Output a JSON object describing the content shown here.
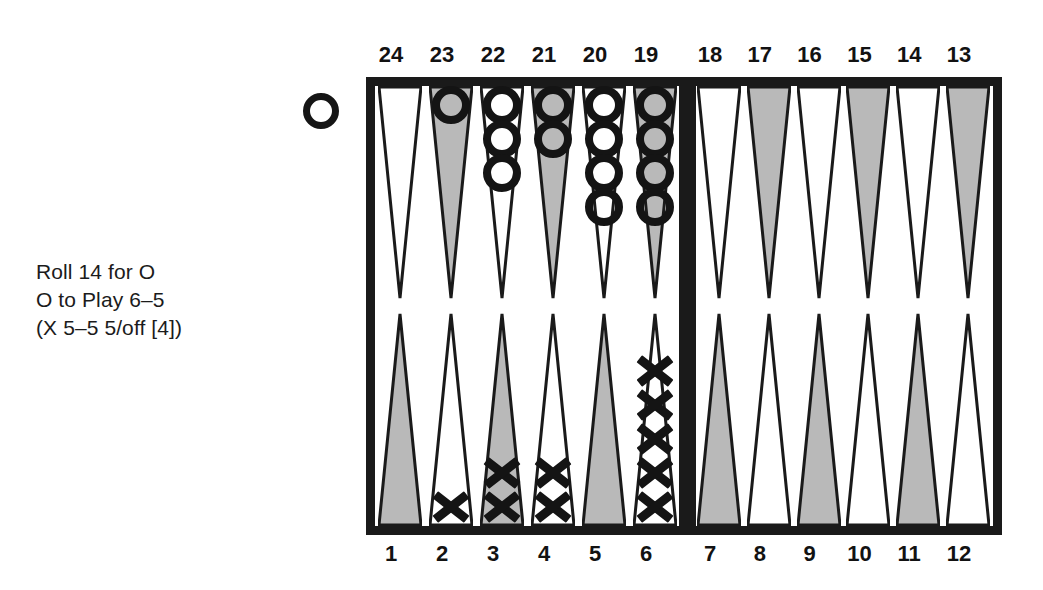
{
  "caption": {
    "line1": "Roll 14 for O",
    "line2": "O to Play 6–5",
    "line3": "(X 5–5 5/off [4])"
  },
  "off_marker": {
    "player": "O",
    "label": "O"
  },
  "colors": {
    "ink": "#1a1a1a",
    "point_shaded": "#b9b9b9",
    "point_light": "#ffffff",
    "background": "#ffffff"
  },
  "board": {
    "numbers_top_left": [
      "24",
      "23",
      "22",
      "21",
      "20",
      "19"
    ],
    "numbers_top_right": [
      "18",
      "17",
      "16",
      "15",
      "14",
      "13"
    ],
    "numbers_bottom_left": [
      "1",
      "2",
      "3",
      "4",
      "5",
      "6"
    ],
    "numbers_bottom_right": [
      "7",
      "8",
      "9",
      "10",
      "11",
      "12"
    ],
    "quadrants": {
      "top_left": [
        {
          "point": "24",
          "shade": "light",
          "checkers": 0,
          "player": ""
        },
        {
          "point": "23",
          "shade": "shaded",
          "checkers": 1,
          "player": "O"
        },
        {
          "point": "22",
          "shade": "light",
          "checkers": 3,
          "player": "O"
        },
        {
          "point": "21",
          "shade": "shaded",
          "checkers": 2,
          "player": "O"
        },
        {
          "point": "20",
          "shade": "light",
          "checkers": 4,
          "player": "O"
        },
        {
          "point": "19",
          "shade": "shaded",
          "checkers": 4,
          "player": "O"
        }
      ],
      "top_right": [
        {
          "point": "18",
          "shade": "light",
          "checkers": 0,
          "player": ""
        },
        {
          "point": "17",
          "shade": "shaded",
          "checkers": 0,
          "player": ""
        },
        {
          "point": "16",
          "shade": "light",
          "checkers": 0,
          "player": ""
        },
        {
          "point": "15",
          "shade": "shaded",
          "checkers": 0,
          "player": ""
        },
        {
          "point": "14",
          "shade": "light",
          "checkers": 0,
          "player": ""
        },
        {
          "point": "13",
          "shade": "shaded",
          "checkers": 0,
          "player": ""
        }
      ],
      "bottom_left": [
        {
          "point": "1",
          "shade": "shaded",
          "checkers": 0,
          "player": ""
        },
        {
          "point": "2",
          "shade": "light",
          "checkers": 1,
          "player": "X"
        },
        {
          "point": "3",
          "shade": "shaded",
          "checkers": 2,
          "player": "X"
        },
        {
          "point": "4",
          "shade": "light",
          "checkers": 2,
          "player": "X"
        },
        {
          "point": "5",
          "shade": "shaded",
          "checkers": 0,
          "player": ""
        },
        {
          "point": "6",
          "shade": "light",
          "checkers": 5,
          "player": "X"
        }
      ],
      "bottom_right": [
        {
          "point": "7",
          "shade": "shaded",
          "checkers": 0,
          "player": ""
        },
        {
          "point": "8",
          "shade": "light",
          "checkers": 0,
          "player": ""
        },
        {
          "point": "9",
          "shade": "shaded",
          "checkers": 0,
          "player": ""
        },
        {
          "point": "10",
          "shade": "light",
          "checkers": 0,
          "player": ""
        },
        {
          "point": "11",
          "shade": "shaded",
          "checkers": 0,
          "player": ""
        },
        {
          "point": "12",
          "shade": "light",
          "checkers": 0,
          "player": ""
        }
      ]
    }
  }
}
